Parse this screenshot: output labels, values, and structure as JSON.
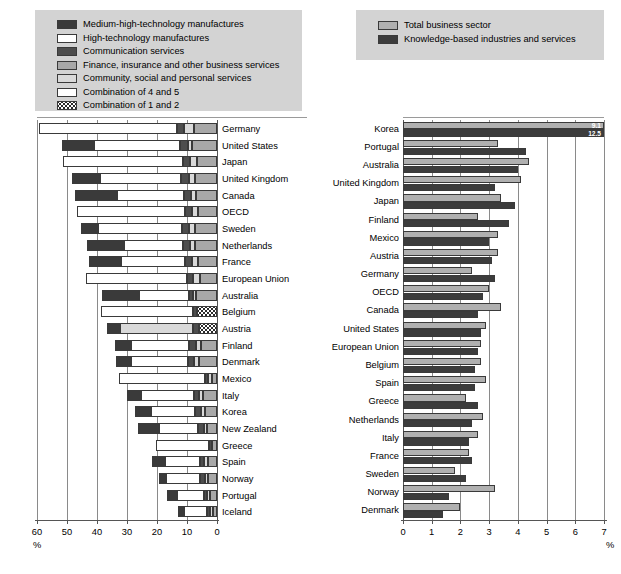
{
  "legend_left": {
    "name": "left-chart-legend",
    "items": [
      {
        "label": "Medium-high-technology manufactures",
        "swatch": "s1",
        "color": "#3a3a3a"
      },
      {
        "label": "High-technology manufactures",
        "swatch": "s2",
        "color": "#ffffff"
      },
      {
        "label": "Communication services",
        "swatch": "s3",
        "color": "#4d4d4d"
      },
      {
        "label": "Finance, insurance and other business services",
        "swatch": "s4",
        "color": "#a8a8a8"
      },
      {
        "label": "Community, social and personal services",
        "swatch": "s5",
        "color": "#d9d9d9"
      },
      {
        "label": "Combination of 4 and 5",
        "swatch": "s45",
        "color": "#ffffff"
      },
      {
        "label": "Combination of 1 and 2",
        "swatch": "s12",
        "color": "#ffffff"
      }
    ]
  },
  "legend_right": {
    "name": "right-chart-legend",
    "items": [
      {
        "label": "Total business sector",
        "swatch": "total",
        "color": "#b0b0b0"
      },
      {
        "label": "Knowledge-based industries and services",
        "swatch": "know",
        "color": "#3c3c3c"
      }
    ]
  },
  "chart_data": [
    {
      "type": "bar",
      "id": "left",
      "orientation": "horizontal",
      "direction": "right-to-left",
      "title": "",
      "xlabel": "%",
      "ylabel": "",
      "xlim": [
        0,
        60
      ],
      "ticks": [
        60,
        50,
        40,
        30,
        20,
        10,
        0
      ],
      "grid": true,
      "legend_position": "top",
      "stacked": true,
      "series_names": [
        "Medium-high-technology manufactures",
        "High-technology manufactures",
        "Communication services",
        "Finance, insurance and other business services",
        "Community, social and personal services",
        "Combination of 4 and 5",
        "Combination of 1 and 2"
      ],
      "categories": [
        "Germany",
        "United States",
        "Japan",
        "United Kingdom",
        "Canada",
        "OECD",
        "Sweden",
        "Netherlands",
        "France",
        "European Union",
        "Australia",
        "Belgium",
        "Austria",
        "Finland",
        "Denmark",
        "Mexico",
        "Italy",
        "Korea",
        "New Zealand",
        "Greece",
        "Spain",
        "Norway",
        "Portugal",
        "Iceland"
      ],
      "rows": [
        {
          "category": "Germany",
          "segments": [
            {
              "s": "s12",
              "v": 0
            },
            {
              "s": "s45",
              "v": 45.8
            },
            {
              "s": "s3",
              "v": 2.5
            },
            {
              "s": "s5",
              "v": 3.3
            },
            {
              "s": "s4",
              "v": 7.7
            }
          ]
        },
        {
          "category": "United States",
          "segments": [
            {
              "s": "s1",
              "v": 10.8
            },
            {
              "s": "s2",
              "v": 28.6
            },
            {
              "s": "s3",
              "v": 2.7
            },
            {
              "s": "s5",
              "v": 1.5
            },
            {
              "s": "s4",
              "v": 8.2
            }
          ]
        },
        {
          "category": "Japan",
          "segments": [
            {
              "s": "s12",
              "v": 0
            },
            {
              "s": "s45",
              "v": 40.1
            },
            {
              "s": "s3",
              "v": 2.4
            },
            {
              "s": "s5",
              "v": 2.3
            },
            {
              "s": "s4",
              "v": 6.7
            }
          ]
        },
        {
          "category": "United Kingdom",
          "segments": [
            {
              "s": "s1",
              "v": 9.2
            },
            {
              "s": "s2",
              "v": 27.2
            },
            {
              "s": "s3",
              "v": 2.6
            },
            {
              "s": "s5",
              "v": 2.0
            },
            {
              "s": "s4",
              "v": 7.3
            }
          ]
        },
        {
          "category": "Canada",
          "segments": [
            {
              "s": "s1",
              "v": 13.8
            },
            {
              "s": "s2",
              "v": 22.4
            },
            {
              "s": "s3",
              "v": 2.3
            },
            {
              "s": "s5",
              "v": 1.8
            },
            {
              "s": "s4",
              "v": 7.0
            }
          ]
        },
        {
          "category": "OECD",
          "segments": [
            {
              "s": "s12",
              "v": 0
            },
            {
              "s": "s45",
              "v": 36.0
            },
            {
              "s": "s3",
              "v": 2.3
            },
            {
              "s": "s5",
              "v": 2.2
            },
            {
              "s": "s4",
              "v": 6.3
            }
          ]
        },
        {
          "category": "Sweden",
          "segments": [
            {
              "s": "s1",
              "v": 5.6
            },
            {
              "s": "s2",
              "v": 27.9
            },
            {
              "s": "s3",
              "v": 2.4
            },
            {
              "s": "s5",
              "v": 1.8
            },
            {
              "s": "s4",
              "v": 7.5
            }
          ]
        },
        {
          "category": "Netherlands",
          "segments": [
            {
              "s": "s1",
              "v": 12.4
            },
            {
              "s": "s2",
              "v": 19.8
            },
            {
              "s": "s3",
              "v": 2.2
            },
            {
              "s": "s5",
              "v": 1.9
            },
            {
              "s": "s4",
              "v": 7.2
            }
          ]
        },
        {
          "category": "France",
          "segments": [
            {
              "s": "s1",
              "v": 10.7
            },
            {
              "s": "s2",
              "v": 21.2
            },
            {
              "s": "s3",
              "v": 2.2
            },
            {
              "s": "s5",
              "v": 2.3
            },
            {
              "s": "s4",
              "v": 6.2
            }
          ]
        },
        {
          "category": "European Union",
          "segments": [
            {
              "s": "s12",
              "v": 0
            },
            {
              "s": "s45",
              "v": 33.6
            },
            {
              "s": "s3",
              "v": 2.1
            },
            {
              "s": "s5",
              "v": 2.1
            },
            {
              "s": "s4",
              "v": 5.8
            }
          ]
        },
        {
          "category": "Australia",
          "segments": [
            {
              "s": "s1",
              "v": 12.1
            },
            {
              "s": "s2",
              "v": 16.8
            },
            {
              "s": "s3",
              "v": 1.3
            },
            {
              "s": "s5",
              "v": 1.0
            },
            {
              "s": "s4",
              "v": 7.0
            }
          ]
        },
        {
          "category": "Belgium",
          "segments": [
            {
              "s": "s45",
              "v": 30.5
            },
            {
              "s": "s3",
              "v": 1.5
            },
            {
              "s": "s12",
              "v": 6.6
            }
          ]
        },
        {
          "category": "Austria",
          "segments": [
            {
              "s": "s1",
              "v": 4.3
            },
            {
              "s": "s5",
              "v": 24.3
            },
            {
              "s": "s3",
              "v": 1.9
            },
            {
              "s": "s12",
              "v": 6.1
            }
          ]
        },
        {
          "category": "Finland",
          "segments": [
            {
              "s": "s1",
              "v": 5.2
            },
            {
              "s": "s2",
              "v": 19.6
            },
            {
              "s": "s3",
              "v": 2.1
            },
            {
              "s": "s5",
              "v": 1.6
            },
            {
              "s": "s4",
              "v": 5.5
            }
          ]
        },
        {
          "category": "Denmark",
          "segments": [
            {
              "s": "s1",
              "v": 5.0
            },
            {
              "s": "s2",
              "v": 19.0
            },
            {
              "s": "s3",
              "v": 2.0
            },
            {
              "s": "s5",
              "v": 1.8
            },
            {
              "s": "s4",
              "v": 6.0
            }
          ]
        },
        {
          "category": "Mexico",
          "segments": [
            {
              "s": "s12",
              "v": 0
            },
            {
              "s": "s45",
              "v": 28.6
            },
            {
              "s": "s3",
              "v": 1.1
            },
            {
              "s": "s5",
              "v": 1.3
            },
            {
              "s": "s4",
              "v": 1.7
            }
          ]
        },
        {
          "category": "Italy",
          "segments": [
            {
              "s": "s1",
              "v": 4.8
            },
            {
              "s": "s2",
              "v": 17.5
            },
            {
              "s": "s3",
              "v": 1.7
            },
            {
              "s": "s5",
              "v": 1.5
            },
            {
              "s": "s4",
              "v": 4.6
            }
          ]
        },
        {
          "category": "Korea",
          "segments": [
            {
              "s": "s1",
              "v": 5.5
            },
            {
              "s": "s2",
              "v": 14.8
            },
            {
              "s": "s3",
              "v": 1.9
            },
            {
              "s": "s5",
              "v": 1.4
            },
            {
              "s": "s4",
              "v": 3.9
            }
          ]
        },
        {
          "category": "New Zealand",
          "segments": [
            {
              "s": "s1",
              "v": 7.0
            },
            {
              "s": "s2",
              "v": 13.2
            },
            {
              "s": "s3",
              "v": 1.8
            },
            {
              "s": "s5",
              "v": 1.2
            },
            {
              "s": "s4",
              "v": 3.2
            }
          ]
        },
        {
          "category": "Greece",
          "segments": [
            {
              "s": "s45",
              "v": 17.6
            },
            {
              "s": "s3",
              "v": 0.8
            },
            {
              "s": "s4",
              "v": 1.8
            }
          ]
        },
        {
          "category": "Spain",
          "segments": [
            {
              "s": "s1",
              "v": 4.6
            },
            {
              "s": "s2",
              "v": 11.6
            },
            {
              "s": "s3",
              "v": 1.4
            },
            {
              "s": "s5",
              "v": 1.2
            },
            {
              "s": "s4",
              "v": 3.0
            }
          ]
        },
        {
          "category": "Norway",
          "segments": [
            {
              "s": "s1",
              "v": 2.4
            },
            {
              "s": "s2",
              "v": 11.5
            },
            {
              "s": "s3",
              "v": 1.5
            },
            {
              "s": "s5",
              "v": 1.1
            },
            {
              "s": "s4",
              "v": 3.0
            }
          ]
        },
        {
          "category": "Portugal",
          "segments": [
            {
              "s": "s1",
              "v": 3.2
            },
            {
              "s": "s2",
              "v": 9.0
            },
            {
              "s": "s3",
              "v": 1.3
            },
            {
              "s": "s5",
              "v": 0.9
            },
            {
              "s": "s4",
              "v": 2.3
            }
          ]
        },
        {
          "category": "Iceland",
          "segments": [
            {
              "s": "s1",
              "v": 2.1
            },
            {
              "s": "s2",
              "v": 7.5
            },
            {
              "s": "s3",
              "v": 1.1
            },
            {
              "s": "s5",
              "v": 0.8
            },
            {
              "s": "s4",
              "v": 1.5
            }
          ]
        }
      ]
    },
    {
      "type": "bar",
      "id": "right",
      "orientation": "horizontal",
      "direction": "left-to-right",
      "title": "",
      "xlabel": "%",
      "ylabel": "",
      "xlim": [
        0,
        7
      ],
      "ticks": [
        0,
        1,
        2,
        3,
        4,
        5,
        6,
        7
      ],
      "grid": true,
      "legend_position": "top",
      "stacked": false,
      "categories": [
        "Korea",
        "Portugal",
        "Australia",
        "United Kingdom",
        "Japan",
        "Finland",
        "Mexico",
        "Austria",
        "Germany",
        "OECD",
        "Canada",
        "United States",
        "European Union",
        "Belgium",
        "Spain",
        "Greece",
        "Netherlands",
        "Italy",
        "France",
        "Sweden",
        "Norway",
        "Denmark"
      ],
      "series": [
        {
          "name": "Total business sector",
          "values": [
            7.0,
            3.3,
            4.4,
            4.1,
            3.4,
            2.6,
            3.3,
            3.3,
            2.4,
            3.0,
            3.4,
            2.9,
            2.7,
            2.7,
            2.9,
            2.2,
            2.8,
            2.6,
            2.3,
            1.8,
            3.2,
            2.0
          ]
        },
        {
          "name": "Knowledge-based industries and services",
          "values": [
            7.0,
            4.3,
            4.0,
            3.2,
            3.9,
            3.7,
            3.0,
            3.1,
            3.2,
            2.8,
            2.6,
            2.7,
            2.6,
            2.5,
            2.5,
            2.6,
            2.4,
            2.3,
            2.4,
            2.2,
            1.6,
            1.4
          ]
        }
      ],
      "annotations": [
        {
          "category": "Korea",
          "series": "Total business sector",
          "value_label": "9.1"
        },
        {
          "category": "Korea",
          "series": "Knowledge-based industries and services",
          "value_label": "12.5"
        }
      ]
    }
  ]
}
